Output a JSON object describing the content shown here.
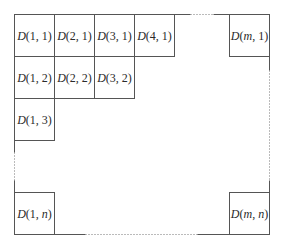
{
  "diagram": {
    "title": "",
    "stroke_color": "#555555",
    "cells": [
      {
        "id": "D11",
        "func": "D",
        "args": [
          "1",
          "1"
        ],
        "italic_args": [
          false,
          false
        ],
        "x": 14,
        "y": 14,
        "w": 40,
        "h": 42
      },
      {
        "id": "D21",
        "func": "D",
        "args": [
          "2",
          "1"
        ],
        "italic_args": [
          false,
          false
        ],
        "x": 54,
        "y": 14,
        "w": 40,
        "h": 42
      },
      {
        "id": "D31",
        "func": "D",
        "args": [
          "3",
          "1"
        ],
        "italic_args": [
          false,
          false
        ],
        "x": 94,
        "y": 14,
        "w": 40,
        "h": 42
      },
      {
        "id": "D41",
        "func": "D",
        "args": [
          "4",
          "1"
        ],
        "italic_args": [
          false,
          false
        ],
        "x": 134,
        "y": 14,
        "w": 40,
        "h": 42
      },
      {
        "id": "Dm1",
        "func": "D",
        "args": [
          "m",
          "1"
        ],
        "italic_args": [
          true,
          false
        ],
        "x": 229,
        "y": 14,
        "w": 40,
        "h": 42
      },
      {
        "id": "D12",
        "func": "D",
        "args": [
          "1",
          "2"
        ],
        "italic_args": [
          false,
          false
        ],
        "x": 14,
        "y": 56,
        "w": 40,
        "h": 42
      },
      {
        "id": "D22",
        "func": "D",
        "args": [
          "2",
          "2"
        ],
        "italic_args": [
          false,
          false
        ],
        "x": 54,
        "y": 56,
        "w": 40,
        "h": 42
      },
      {
        "id": "D32",
        "func": "D",
        "args": [
          "3",
          "2"
        ],
        "italic_args": [
          false,
          false
        ],
        "x": 94,
        "y": 56,
        "w": 40,
        "h": 42
      },
      {
        "id": "D13",
        "func": "D",
        "args": [
          "1",
          "3"
        ],
        "italic_args": [
          false,
          false
        ],
        "x": 14,
        "y": 98,
        "w": 40,
        "h": 42
      },
      {
        "id": "D1n",
        "func": "D",
        "args": [
          "1",
          "n"
        ],
        "italic_args": [
          false,
          true
        ],
        "x": 14,
        "y": 192,
        "w": 40,
        "h": 42
      },
      {
        "id": "Dmn",
        "func": "D",
        "args": [
          "m",
          "n"
        ],
        "italic_args": [
          true,
          true
        ],
        "x": 229,
        "y": 192,
        "w": 40,
        "h": 42
      }
    ],
    "labels": {
      "D11": "D(1, 1)",
      "D21": "D(2, 1)",
      "D31": "D(3, 1)",
      "D41": "D(4, 1)",
      "Dm1": "D(m, 1)",
      "D12": "D(1, 2)",
      "D22": "D(2, 2)",
      "D32": "D(3, 2)",
      "D13": "D(1, 3)",
      "D1n": "D(1, n)",
      "Dmn": "D(m, n)"
    },
    "outer_boundary": {
      "top": [
        {
          "x1": 174,
          "y1": 14,
          "x2": 190,
          "y2": 14,
          "style": "solid"
        },
        {
          "x1": 190,
          "y1": 14,
          "x2": 213,
          "y2": 14,
          "style": "dotted"
        },
        {
          "x1": 213,
          "y1": 14,
          "x2": 229,
          "y2": 14,
          "style": "solid"
        }
      ],
      "right": [
        {
          "x1": 269,
          "y1": 56,
          "x2": 269,
          "y2": 70,
          "style": "solid"
        },
        {
          "x1": 269,
          "y1": 70,
          "x2": 269,
          "y2": 180,
          "style": "dotted"
        },
        {
          "x1": 269,
          "y1": 180,
          "x2": 269,
          "y2": 192,
          "style": "solid"
        }
      ],
      "bottom": [
        {
          "x1": 54,
          "y1": 234,
          "x2": 85,
          "y2": 234,
          "style": "solid"
        },
        {
          "x1": 85,
          "y1": 234,
          "x2": 197,
          "y2": 234,
          "style": "dotted"
        },
        {
          "x1": 197,
          "y1": 234,
          "x2": 229,
          "y2": 234,
          "style": "solid"
        }
      ],
      "left": [
        {
          "x1": 14,
          "y1": 140,
          "x2": 14,
          "y2": 152,
          "style": "solid"
        },
        {
          "x1": 14,
          "y1": 152,
          "x2": 14,
          "y2": 180,
          "style": "dotted"
        },
        {
          "x1": 14,
          "y1": 180,
          "x2": 14,
          "y2": 192,
          "style": "solid"
        }
      ]
    }
  }
}
